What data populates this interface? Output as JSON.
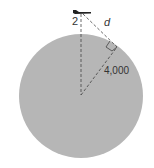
{
  "diagram": {
    "labels": {
      "altitude": "2",
      "distance": "d",
      "radius": "4,000"
    },
    "colors": {
      "planet_fill": "#b6b6b6",
      "line": "#444444",
      "plane": "#222222",
      "text": "#333333"
    }
  }
}
